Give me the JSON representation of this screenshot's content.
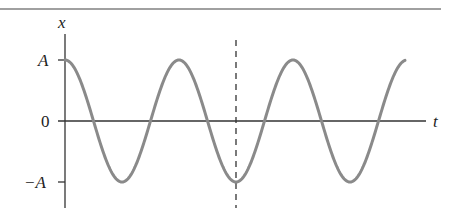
{
  "figure": {
    "y_axis_label": "x",
    "x_axis_label": "t",
    "tick_labels": {
      "top": "A",
      "zero": "0",
      "bottom": "−A"
    },
    "colors": {
      "curve": "#8a8a8a",
      "axes": "#333333",
      "rule": "#9a9a9a",
      "dashed": "#333333"
    }
  },
  "chart_data": {
    "type": "line",
    "title": "",
    "xlabel": "t",
    "ylabel": "x",
    "yticks": [
      "-A",
      "0",
      "A"
    ],
    "function": "x = A cos(2π t / T)",
    "cycles_shown": 3,
    "annotations": [
      "vertical dashed line at t = 1.5T (trough, x = -A)"
    ],
    "series": [
      {
        "name": "x(t)",
        "x": [
          0,
          0.25,
          0.5,
          0.75,
          1,
          1.25,
          1.5,
          1.75,
          2,
          2.25,
          2.5,
          2.75,
          3
        ],
        "values": [
          1,
          0,
          -1,
          0,
          1,
          0,
          -1,
          0,
          1,
          0,
          -1,
          0,
          1
        ]
      }
    ]
  }
}
